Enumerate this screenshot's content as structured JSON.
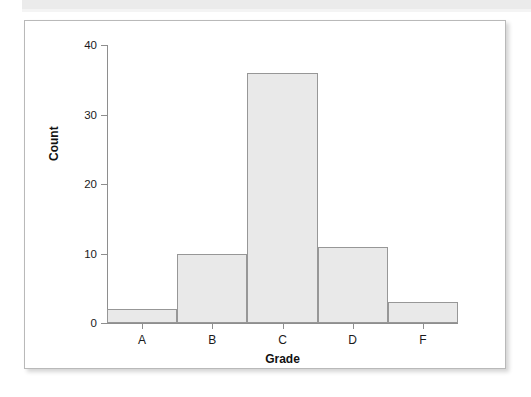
{
  "chart_data": {
    "type": "bar",
    "title": "",
    "subtitle": "",
    "xlabel": "Grade",
    "ylabel": "Count",
    "categories": [
      "A",
      "B",
      "C",
      "D",
      "F"
    ],
    "values": [
      2,
      10,
      36,
      11,
      3
    ],
    "series": [
      {
        "name": "Count",
        "values": [
          2,
          10,
          36,
          11,
          3
        ]
      }
    ],
    "ylim": [
      0,
      40
    ],
    "yticks": [
      0,
      10,
      20,
      30,
      40
    ],
    "ytick_labels": [
      "0",
      "10",
      "20",
      "30",
      "40"
    ],
    "xtick_labels": [
      "A",
      "B",
      "C",
      "D",
      "F"
    ],
    "grid": false,
    "legend": false,
    "legend_position": "none",
    "bar_fill_color": "#e9e9e9",
    "bar_edge_color": "#979797",
    "axis_color": "#8e8e8e",
    "text_color": "#1a1a1a",
    "background_color": "#ffffff"
  },
  "figure": {
    "card_background": "#ffffff",
    "card_border_color": "#b9b9b9",
    "top_band_color": "#ebebeb"
  }
}
